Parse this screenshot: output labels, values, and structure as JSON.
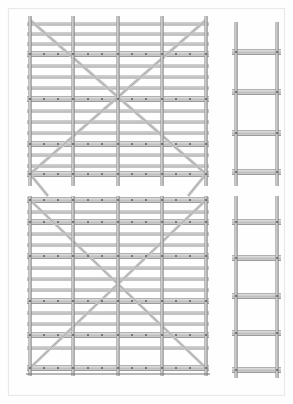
{
  "document": {
    "kind": "technical-drawing",
    "subject": "modular scaffolding elevation and end-frame",
    "background_color": "#ffffff",
    "border_color": "#e9e9e9",
    "canvas": {
      "width": 293,
      "height": 404
    }
  },
  "palette": {
    "tube_fill": "#c9c9c9",
    "tube_fill_light": "#dedede",
    "tube_edge": "#8c8c8c",
    "tube_edge_dark": "#6f6f6f",
    "node_dot": "#5a5a5a",
    "brace": "#9a9a9a",
    "ground_line": "#707070"
  },
  "views": [
    {
      "id": "elevation-upper",
      "name": "upper-elevation-view",
      "label": "Upper bay elevation",
      "frame": {
        "x": 30,
        "y": 20,
        "width": 176,
        "height": 158
      },
      "standards_x": [
        30,
        73,
        118,
        162,
        206
      ],
      "standard_top_overhang": 4,
      "standard_bottom_overhang": 8,
      "ledger_rows": [
        {
          "y": 24,
          "type": "tube",
          "thickness": 2.2
        },
        {
          "y": 34,
          "type": "tube",
          "thickness": 2.2
        },
        {
          "y": 44,
          "type": "tube",
          "thickness": 2.2
        },
        {
          "y": 54,
          "type": "deck",
          "thickness": 5.0
        },
        {
          "y": 66,
          "type": "tube",
          "thickness": 2.2
        },
        {
          "y": 77,
          "type": "tube",
          "thickness": 2.2
        },
        {
          "y": 88,
          "type": "tube",
          "thickness": 2.2
        },
        {
          "y": 99,
          "type": "deck",
          "thickness": 5.0
        },
        {
          "y": 111,
          "type": "tube",
          "thickness": 2.2
        },
        {
          "y": 122,
          "type": "tube",
          "thickness": 2.2
        },
        {
          "y": 133,
          "type": "tube",
          "thickness": 2.2
        },
        {
          "y": 144,
          "type": "deck",
          "thickness": 5.0
        },
        {
          "y": 155,
          "type": "tube",
          "thickness": 2.2
        },
        {
          "y": 166,
          "type": "tube",
          "thickness": 2.2
        },
        {
          "y": 174,
          "type": "deck",
          "thickness": 5.0
        }
      ],
      "braces": [
        {
          "from": [
            30,
            174
          ],
          "to": [
            206,
            20
          ]
        },
        {
          "from": [
            30,
            20
          ],
          "to": [
            206,
            174
          ]
        }
      ],
      "brace_stubs": [
        {
          "from": [
            30,
            174
          ],
          "to": [
            48,
            196
          ]
        },
        {
          "from": [
            206,
            174
          ],
          "to": [
            188,
            196
          ]
        }
      ],
      "node_rows_y": [
        54,
        99,
        144,
        174
      ],
      "node_columns_x": [
        30,
        44,
        58,
        73,
        88,
        102,
        118,
        132,
        146,
        162,
        176,
        190,
        206
      ]
    },
    {
      "id": "elevation-lower",
      "name": "lower-elevation-view",
      "label": "Lower bay elevation",
      "frame": {
        "x": 30,
        "y": 198,
        "width": 176,
        "height": 176
      },
      "standards_x": [
        30,
        73,
        118,
        162,
        206
      ],
      "standard_top_overhang": 2,
      "standard_bottom_overhang": 2,
      "ledger_rows": [
        {
          "y": 200,
          "type": "deck",
          "thickness": 5.0
        },
        {
          "y": 212,
          "type": "tube",
          "thickness": 2.2
        },
        {
          "y": 222,
          "type": "deck",
          "thickness": 5.0
        },
        {
          "y": 234,
          "type": "tube",
          "thickness": 2.2
        },
        {
          "y": 245,
          "type": "tube",
          "thickness": 2.2
        },
        {
          "y": 256,
          "type": "deck",
          "thickness": 5.0
        },
        {
          "y": 268,
          "type": "tube",
          "thickness": 2.2
        },
        {
          "y": 279,
          "type": "tube",
          "thickness": 2.2
        },
        {
          "y": 290,
          "type": "tube",
          "thickness": 2.2
        },
        {
          "y": 301,
          "type": "deck",
          "thickness": 5.0
        },
        {
          "y": 313,
          "type": "tube",
          "thickness": 2.2
        },
        {
          "y": 324,
          "type": "tube",
          "thickness": 2.2
        },
        {
          "y": 335,
          "type": "deck",
          "thickness": 5.0
        },
        {
          "y": 348,
          "type": "tube",
          "thickness": 2.2
        },
        {
          "y": 368,
          "type": "deck",
          "thickness": 5.0
        }
      ],
      "braces": [
        {
          "from": [
            30,
            368
          ],
          "to": [
            206,
            200
          ]
        },
        {
          "from": [
            30,
            200
          ],
          "to": [
            206,
            368
          ]
        }
      ],
      "brace_stubs": [],
      "node_rows_y": [
        200,
        222,
        256,
        301,
        335,
        368
      ],
      "node_columns_x": [
        30,
        44,
        58,
        73,
        88,
        102,
        118,
        132,
        146,
        162,
        176,
        190,
        206
      ],
      "ground_line": {
        "x1": 26,
        "x2": 210,
        "y": 374
      }
    },
    {
      "id": "end-frame-upper",
      "name": "upper-end-frame-view",
      "label": "Upper end frame",
      "posts_x": [
        236,
        277
      ],
      "post_top": 22,
      "post_bottom": 186,
      "rungs": [
        {
          "y": 52,
          "type": "deck",
          "thickness": 5.0
        },
        {
          "y": 92,
          "type": "deck",
          "thickness": 5.0
        },
        {
          "y": 133,
          "type": "deck",
          "thickness": 5.0
        },
        {
          "y": 172,
          "type": "deck",
          "thickness": 5.0
        }
      ]
    },
    {
      "id": "end-frame-lower",
      "name": "lower-end-frame-view",
      "label": "Lower end frame",
      "posts_x": [
        236,
        277
      ],
      "post_top": 196,
      "post_bottom": 378,
      "rungs": [
        {
          "y": 222,
          "type": "deck",
          "thickness": 5.0
        },
        {
          "y": 258,
          "type": "deck",
          "thickness": 5.0
        },
        {
          "y": 296,
          "type": "deck",
          "thickness": 5.0
        },
        {
          "y": 333,
          "type": "deck",
          "thickness": 5.0
        },
        {
          "y": 370,
          "type": "deck",
          "thickness": 5.0
        }
      ]
    }
  ]
}
